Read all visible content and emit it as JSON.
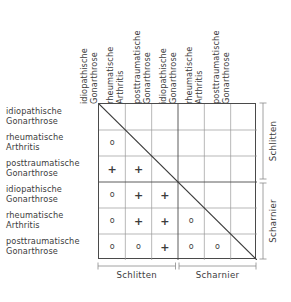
{
  "chart_data": {
    "type": "table",
    "title": "",
    "row_labels": [
      {
        "line1": "idiopathische",
        "line2": "Gonarthrose"
      },
      {
        "line1": "rheumatische",
        "line2": "Arthritis"
      },
      {
        "line1": "posttraumatische",
        "line2": "Gonarthrose"
      },
      {
        "line1": "idiopathische",
        "line2": "Gonarthrose"
      },
      {
        "line1": "rheumatische",
        "line2": "Arthritis"
      },
      {
        "line1": "posttraumatische",
        "line2": "Gonarthrose"
      }
    ],
    "col_labels": [
      {
        "line1": "idiopathische",
        "line2": "Gonarthrose"
      },
      {
        "line1": "rheumatische",
        "line2": "Arthritis"
      },
      {
        "line1": "posttraumatische",
        "line2": "Gonarthrose"
      },
      {
        "line1": "idiopathische",
        "line2": "Gonarthrose"
      },
      {
        "line1": "rheumatische",
        "line2": "Arthritis"
      },
      {
        "line1": "posttraumatische",
        "line2": "Gonarthrose"
      }
    ],
    "group_labels_bottom": [
      "Schlitten",
      "Scharnier"
    ],
    "group_labels_right": [
      "Schlitten",
      "Scharnier"
    ],
    "group_split_index": 3,
    "symbols": {
      "plus": "+",
      "circle": "o"
    },
    "cells": [
      [
        "",
        "",
        "",
        "",
        "",
        ""
      ],
      [
        "o",
        "",
        "",
        "",
        "",
        ""
      ],
      [
        "+",
        "+",
        "",
        "",
        "",
        ""
      ],
      [
        "o",
        "+",
        "+",
        "",
        "",
        ""
      ],
      [
        "o",
        "+",
        "+",
        "o",
        "",
        ""
      ],
      [
        "o",
        "o",
        "+",
        "o",
        "o",
        ""
      ]
    ],
    "grid": {
      "rows": 6,
      "cols": 6,
      "diagonal": true
    },
    "colors": {
      "text": "#3c3c3c",
      "grid_minor": "#9a9a9a",
      "grid_major": "#4a4a4a",
      "diagonal": "#3a3a3a",
      "bracket": "#8a8a8a",
      "background": "#ffffff"
    }
  }
}
